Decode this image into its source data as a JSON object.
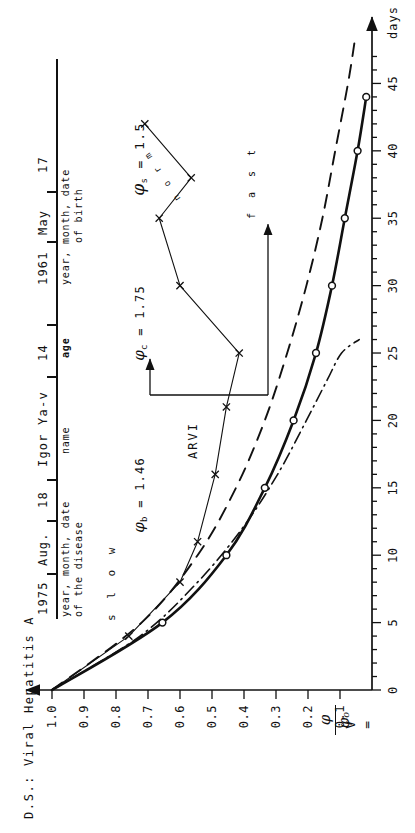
{
  "figure": {
    "diagnosis_prefix": "D.S.:",
    "diagnosis": "D.S.: Viral Hepatitis A",
    "orientation": "rotated-90-ccw"
  },
  "header_form": {
    "fields": [
      {
        "value": "1975",
        "caption": ""
      },
      {
        "value": "Aug.",
        "caption": ""
      },
      {
        "value": "18",
        "caption": ""
      },
      {
        "value": "Igor Ya-v",
        "caption": "name"
      },
      {
        "value": "14",
        "caption": "age"
      },
      {
        "value": "1961",
        "caption": ""
      },
      {
        "value": "May",
        "caption": ""
      },
      {
        "value": "17",
        "caption": ""
      }
    ],
    "caption_disease_line1": "year, month, date",
    "caption_disease_line2": "of the disease",
    "caption_name": "name",
    "caption_age": "age",
    "caption_birth_line1": "year, month, date",
    "caption_birth_line2": "of birth"
  },
  "parameters": [
    {
      "symbol": "φ",
      "subscript": "b",
      "equals": "=",
      "value": "1.46",
      "text": "φb = 1.46"
    },
    {
      "symbol": "φ",
      "subscript": "c",
      "equals": "=",
      "value": "1.75",
      "text": "φc = 1.75"
    },
    {
      "symbol": "φ",
      "subscript": "s",
      "equals": "=",
      "value": "1.5",
      "text": "φs = 1.5"
    }
  ],
  "annotations": {
    "arvi": "ARVI",
    "slow": "s l o w",
    "fast": "f a s t",
    "norm": "n o r m"
  },
  "axes": {
    "y_label_v": "V",
    "y_label_eq": "=",
    "y_label_num": "φ",
    "y_label_den": "φₒ",
    "y_label_full": "V = φ/φₒ",
    "y_ticks": [
      "1.0",
      "0.9",
      "0.8",
      "0.7",
      "0.6",
      "0.5",
      "0.4",
      "0.3",
      "0.2",
      "0.1"
    ],
    "y_min": 0.0,
    "y_max": 1.0,
    "x_ticks": [
      "0",
      "5",
      "10",
      "15",
      "20",
      "25",
      "30",
      "35",
      "40",
      "45"
    ],
    "x_unit": "days",
    "x_min": 0,
    "x_max": 48,
    "x_minor_step": 1,
    "x_major_step": 5
  },
  "chart_data": {
    "type": "line",
    "title": "D.S.: Viral Hepatitis A",
    "xlabel": "days",
    "ylabel": "V = φ/φₒ",
    "xlim": [
      0,
      48
    ],
    "ylim": [
      0,
      1.0
    ],
    "grid": false,
    "legend": "inline-labels",
    "series": [
      {
        "name": "slow",
        "label": "s l o w",
        "style": "thin-solid",
        "marker": "x",
        "color": "#111111",
        "note": "patient observed curve with ARVI relapse after day 25",
        "points": [
          {
            "x": 0,
            "y": 1.0
          },
          {
            "x": 4,
            "y": 0.76
          },
          {
            "x": 8,
            "y": 0.6
          },
          {
            "x": 11,
            "y": 0.545
          },
          {
            "x": 16,
            "y": 0.49
          },
          {
            "x": 21,
            "y": 0.455
          },
          {
            "x": 25,
            "y": 0.415
          },
          {
            "x": 30,
            "y": 0.6
          },
          {
            "x": 35,
            "y": 0.665
          },
          {
            "x": 38,
            "y": 0.565
          },
          {
            "x": 42,
            "y": 0.71
          }
        ]
      },
      {
        "name": "slow-reference",
        "label": "",
        "style": "dashed",
        "marker": "none",
        "color": "#111111",
        "points": [
          {
            "x": 0,
            "y": 1.0
          },
          {
            "x": 5,
            "y": 0.72
          },
          {
            "x": 10,
            "y": 0.545
          },
          {
            "x": 15,
            "y": 0.425
          },
          {
            "x": 20,
            "y": 0.335
          },
          {
            "x": 25,
            "y": 0.265
          },
          {
            "x": 30,
            "y": 0.205
          },
          {
            "x": 35,
            "y": 0.155
          },
          {
            "x": 40,
            "y": 0.115
          },
          {
            "x": 45,
            "y": 0.075
          },
          {
            "x": 48,
            "y": 0.055
          }
        ]
      },
      {
        "name": "norm",
        "label": "n o r m",
        "style": "thick-solid",
        "marker": "circle",
        "color": "#111111",
        "points": [
          {
            "x": 0,
            "y": 1.0
          },
          {
            "x": 5,
            "y": 0.655
          },
          {
            "x": 10,
            "y": 0.455
          },
          {
            "x": 15,
            "y": 0.335
          },
          {
            "x": 20,
            "y": 0.245
          },
          {
            "x": 25,
            "y": 0.175
          },
          {
            "x": 30,
            "y": 0.125
          },
          {
            "x": 35,
            "y": 0.085
          },
          {
            "x": 40,
            "y": 0.045
          },
          {
            "x": 44,
            "y": 0.018
          }
        ]
      },
      {
        "name": "fast",
        "label": "f a s t",
        "style": "dash-dot",
        "marker": "none",
        "color": "#111111",
        "points": [
          {
            "x": 0,
            "y": 1.0
          },
          {
            "x": 4,
            "y": 0.725
          },
          {
            "x": 8,
            "y": 0.545
          },
          {
            "x": 12,
            "y": 0.405
          },
          {
            "x": 16,
            "y": 0.295
          },
          {
            "x": 20,
            "y": 0.205
          },
          {
            "x": 23,
            "y": 0.14
          },
          {
            "x": 25,
            "y": 0.095
          },
          {
            "x": 26,
            "y": 0.04
          }
        ]
      }
    ]
  }
}
